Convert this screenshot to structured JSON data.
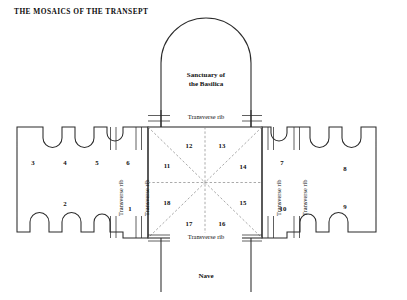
{
  "document": {
    "title": "THE MOSAICS OF THE TRANSEPT",
    "type": "architectural-floor-plan"
  },
  "plan": {
    "sanctuary_label_line1": "Sanctuary of",
    "sanctuary_label_line2": "the Basilica",
    "nave_label": "Nave",
    "rib_label": "Transverse rib",
    "ribs": {
      "top_horizontal": "Transverse rib",
      "bottom_horizontal": "Transverse rib",
      "left_outer_vertical": "Transverse rib",
      "left_inner_vertical": "Transverse rib",
      "right_inner_vertical": "Transverse rib",
      "right_outer_vertical": "Transverse rib"
    }
  },
  "bays": {
    "left_arm": [
      {
        "id": "1",
        "label": "1"
      },
      {
        "id": "2",
        "label": "2"
      },
      {
        "id": "3",
        "label": "3"
      },
      {
        "id": "4",
        "label": "4"
      },
      {
        "id": "5",
        "label": "5"
      },
      {
        "id": "6",
        "label": "6"
      }
    ],
    "right_arm": [
      {
        "id": "7",
        "label": "7"
      },
      {
        "id": "8",
        "label": "8"
      },
      {
        "id": "9",
        "label": "9"
      },
      {
        "id": "10",
        "label": "10"
      }
    ],
    "crossing": [
      {
        "id": "11",
        "label": "11"
      },
      {
        "id": "12",
        "label": "12"
      },
      {
        "id": "13",
        "label": "13"
      },
      {
        "id": "14",
        "label": "14"
      },
      {
        "id": "15",
        "label": "15"
      },
      {
        "id": "16",
        "label": "16"
      },
      {
        "id": "17",
        "label": "17"
      },
      {
        "id": "18",
        "label": "18"
      }
    ]
  },
  "colors": {
    "ink": "#111111",
    "outline": "#2b2b2b",
    "dashed": "#8d8d8d",
    "paper": "#ffffff"
  }
}
